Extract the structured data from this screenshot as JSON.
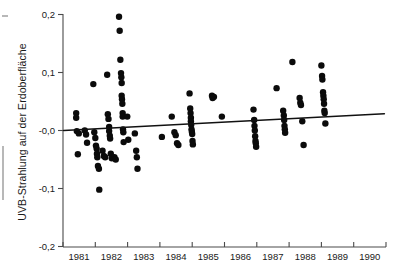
{
  "figure": {
    "background_color": "#ffffff",
    "ink_color": "#0b0b0b",
    "axis_color": "#4a4a4a"
  },
  "chart_data": {
    "type": "scatter",
    "title": "",
    "xlabel": "",
    "ylabel": "UVB-Strahlung auf der Erdoberfläche",
    "xlim": [
      1980.6,
      1990.4
    ],
    "ylim": [
      -0.2,
      0.2
    ],
    "grid": false,
    "legend": null,
    "x_tick_labels": [
      "1981",
      "1982",
      "1983",
      "1984",
      "1985",
      "1986",
      "1987",
      "1988",
      "1989",
      "1990"
    ],
    "x_tick_values": [
      1981,
      1982,
      1983,
      1984,
      1985,
      1986,
      1987,
      1988,
      1989,
      1990
    ],
    "y_tick_labels": [
      "0,2",
      "0,1",
      "-0,0",
      "-0,1",
      "-0,2"
    ],
    "y_tick_values": [
      0.2,
      0.1,
      0.0,
      -0.1,
      -0.2
    ],
    "series": [
      {
        "name": "UVB-Messwerte",
        "marker": "filled-circle",
        "marker_size": 3.2,
        "color": "#0b0b0b",
        "points": [
          [
            1981.0,
            0.03
          ],
          [
            1981.0,
            0.022
          ],
          [
            1981.02,
            -0.001
          ],
          [
            1981.08,
            -0.005
          ],
          [
            1981.05,
            -0.041
          ],
          [
            1981.26,
            0.0
          ],
          [
            1981.3,
            -0.007
          ],
          [
            1981.33,
            -0.021
          ],
          [
            1981.52,
            0.08
          ],
          [
            1981.55,
            -0.003
          ],
          [
            1981.58,
            -0.013
          ],
          [
            1981.6,
            -0.026
          ],
          [
            1981.62,
            -0.031
          ],
          [
            1981.63,
            -0.04
          ],
          [
            1981.64,
            -0.046
          ],
          [
            1981.66,
            -0.061
          ],
          [
            1981.69,
            -0.066
          ],
          [
            1981.7,
            -0.102
          ],
          [
            1981.8,
            -0.035
          ],
          [
            1981.84,
            -0.044
          ],
          [
            1981.88,
            -0.046
          ],
          [
            1981.94,
            0.096
          ],
          [
            1981.96,
            0.028
          ],
          [
            1981.98,
            0.02
          ],
          [
            1982.0,
            0.006
          ],
          [
            1982.0,
            -0.001
          ],
          [
            1982.02,
            -0.009
          ],
          [
            1982.03,
            -0.014
          ],
          [
            1982.05,
            -0.04
          ],
          [
            1982.08,
            -0.048
          ],
          [
            1982.16,
            -0.046
          ],
          [
            1982.2,
            -0.05
          ],
          [
            1982.3,
            0.196
          ],
          [
            1982.32,
            0.172
          ],
          [
            1982.34,
            0.122
          ],
          [
            1982.36,
            0.099
          ],
          [
            1982.37,
            0.092
          ],
          [
            1982.38,
            0.082
          ],
          [
            1982.38,
            0.06
          ],
          [
            1982.39,
            0.054
          ],
          [
            1982.4,
            0.046
          ],
          [
            1982.41,
            0.03
          ],
          [
            1982.41,
            0.024
          ],
          [
            1982.42,
            0.002
          ],
          [
            1982.43,
            -0.003
          ],
          [
            1982.44,
            -0.02
          ],
          [
            1982.55,
            0.024
          ],
          [
            1982.58,
            -0.016
          ],
          [
            1982.78,
            -0.005
          ],
          [
            1982.82,
            -0.035
          ],
          [
            1982.84,
            -0.046
          ],
          [
            1982.86,
            -0.066
          ],
          [
            1983.6,
            -0.011
          ],
          [
            1983.9,
            0.024
          ],
          [
            1983.98,
            -0.003
          ],
          [
            1984.02,
            -0.008
          ],
          [
            1984.06,
            -0.022
          ],
          [
            1984.1,
            -0.025
          ],
          [
            1984.44,
            0.064
          ],
          [
            1984.46,
            0.038
          ],
          [
            1984.47,
            0.03
          ],
          [
            1984.48,
            0.022
          ],
          [
            1984.48,
            0.016
          ],
          [
            1984.49,
            0.01
          ],
          [
            1984.5,
            0.002
          ],
          [
            1984.51,
            -0.002
          ],
          [
            1984.52,
            -0.006
          ],
          [
            1984.53,
            -0.018
          ],
          [
            1984.54,
            -0.024
          ],
          [
            1985.12,
            0.06
          ],
          [
            1985.14,
            0.056
          ],
          [
            1985.18,
            0.058
          ],
          [
            1985.42,
            0.024
          ],
          [
            1986.38,
            0.036
          ],
          [
            1986.4,
            0.018
          ],
          [
            1986.41,
            0.008
          ],
          [
            1986.42,
            0.0
          ],
          [
            1986.43,
            -0.01
          ],
          [
            1986.44,
            -0.018
          ],
          [
            1986.45,
            -0.022
          ],
          [
            1986.46,
            -0.028
          ],
          [
            1987.08,
            0.073
          ],
          [
            1987.28,
            0.034
          ],
          [
            1987.3,
            0.026
          ],
          [
            1987.31,
            0.018
          ],
          [
            1987.32,
            0.008
          ],
          [
            1987.33,
            0.002
          ],
          [
            1987.34,
            -0.004
          ],
          [
            1987.56,
            0.118
          ],
          [
            1987.78,
            0.056
          ],
          [
            1987.8,
            0.048
          ],
          [
            1987.82,
            0.044
          ],
          [
            1987.86,
            0.016
          ],
          [
            1987.9,
            -0.025
          ],
          [
            1988.44,
            0.112
          ],
          [
            1988.46,
            0.094
          ],
          [
            1988.47,
            0.088
          ],
          [
            1988.49,
            0.066
          ],
          [
            1988.5,
            0.06
          ],
          [
            1988.51,
            0.054
          ],
          [
            1988.52,
            0.046
          ],
          [
            1988.53,
            0.034
          ],
          [
            1988.54,
            0.03
          ],
          [
            1988.56,
            0.012
          ]
        ]
      }
    ],
    "trend_line": {
      "name": "Regressionsgerade",
      "x_start": 1980.62,
      "y_start": 0.0,
      "x_end": 1990.35,
      "y_end": 0.029,
      "color": "#111111"
    }
  }
}
